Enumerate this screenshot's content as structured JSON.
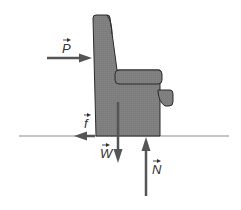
{
  "diagram": {
    "forces": [
      {
        "id": "P",
        "label": "P",
        "direction": "right",
        "description": "applied push"
      },
      {
        "id": "f",
        "label": "f",
        "direction": "left",
        "description": "friction"
      },
      {
        "id": "W",
        "label": "W",
        "direction": "down",
        "description": "weight"
      },
      {
        "id": "N",
        "label": "N",
        "direction": "up",
        "description": "normal force"
      }
    ],
    "colors": {
      "chair_fill": "#7f7f7f",
      "outline": "#2b2b2b",
      "arrow": "#555555",
      "ground": "#888888"
    }
  }
}
